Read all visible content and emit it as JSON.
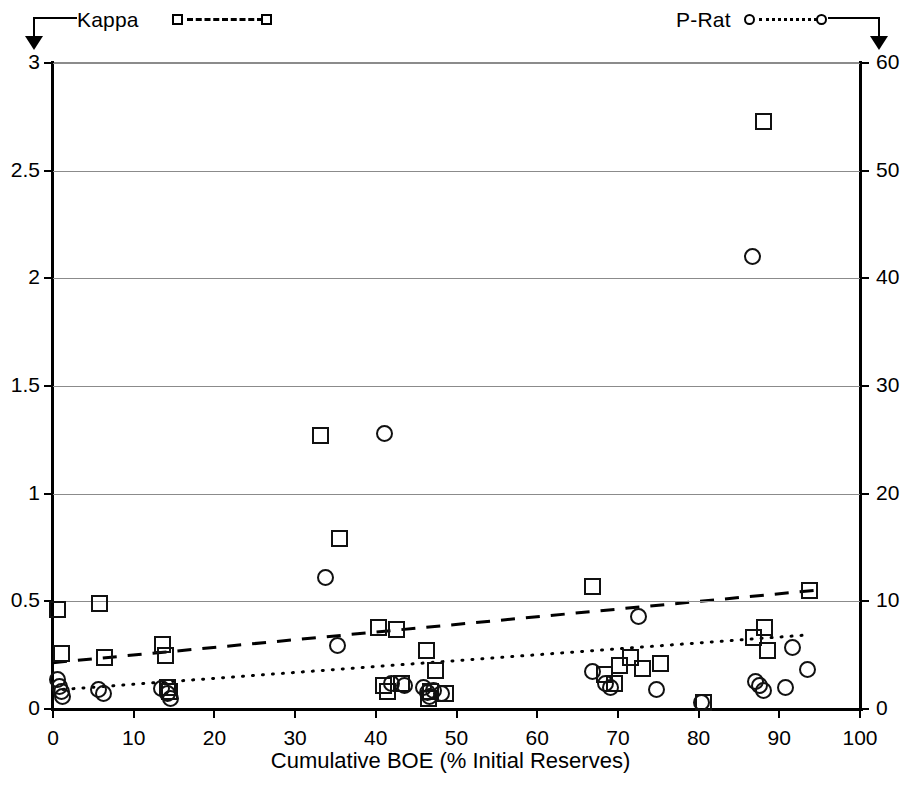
{
  "legend": {
    "kappa": {
      "label": "Kappa",
      "marker": "square",
      "line": "dashed",
      "axis": "left"
    },
    "prat": {
      "label": "P-Rat",
      "marker": "circle",
      "line": "dotted",
      "axis": "right"
    }
  },
  "chart_data": {
    "type": "scatter",
    "title": "",
    "xlabel": "Cumulative BOE (% Initial Reserves)",
    "ylabel_left": "",
    "ylabel_right": "",
    "xlim": [
      0,
      100
    ],
    "ylim_left": [
      0,
      3
    ],
    "ylim_right": [
      0,
      60
    ],
    "xticks": [
      0,
      10,
      20,
      30,
      40,
      50,
      60,
      70,
      80,
      90,
      100
    ],
    "yticks_left": [
      0,
      0.5,
      1,
      1.5,
      2,
      2.5,
      3
    ],
    "yticks_right": [
      0,
      10,
      20,
      30,
      40,
      50,
      60
    ],
    "grid": true,
    "legend_position": "top",
    "series": [
      {
        "name": "Kappa",
        "marker": "square",
        "axis": "left",
        "points": [
          [
            0.6,
            0.46
          ],
          [
            1.0,
            0.26
          ],
          [
            5.8,
            0.49
          ],
          [
            6.4,
            0.24
          ],
          [
            13.6,
            0.3
          ],
          [
            14.0,
            0.25
          ],
          [
            14.2,
            0.1
          ],
          [
            14.4,
            0.08
          ],
          [
            33.2,
            1.27
          ],
          [
            35.5,
            0.79
          ],
          [
            40.3,
            0.38
          ],
          [
            41.0,
            0.11
          ],
          [
            41.4,
            0.08
          ],
          [
            42.6,
            0.37
          ],
          [
            43.2,
            0.12
          ],
          [
            46.3,
            0.27
          ],
          [
            46.5,
            0.05
          ],
          [
            46.8,
            0.08
          ],
          [
            47.4,
            0.18
          ],
          [
            48.6,
            0.07
          ],
          [
            66.8,
            0.57
          ],
          [
            68.4,
            0.16
          ],
          [
            69.6,
            0.12
          ],
          [
            71.5,
            0.24
          ],
          [
            70.2,
            0.2
          ],
          [
            73.0,
            0.19
          ],
          [
            75.3,
            0.21
          ],
          [
            80.6,
            0.03
          ],
          [
            86.8,
            0.33
          ],
          [
            88.0,
            2.73
          ],
          [
            88.2,
            0.38
          ],
          [
            88.5,
            0.27
          ],
          [
            93.8,
            0.55
          ]
        ]
      },
      {
        "name": "P-Rat",
        "marker": "circle",
        "axis": "right",
        "points": [
          [
            0.5,
            2.7
          ],
          [
            0.8,
            2.1
          ],
          [
            1.0,
            1.6
          ],
          [
            1.2,
            1.2
          ],
          [
            5.6,
            1.8
          ],
          [
            6.2,
            1.4
          ],
          [
            13.5,
            1.9
          ],
          [
            14.2,
            1.4
          ],
          [
            14.6,
            1.0
          ],
          [
            33.8,
            12.2
          ],
          [
            35.3,
            5.9
          ],
          [
            41.1,
            25.6
          ],
          [
            45.9,
            2.0
          ],
          [
            46.4,
            1.5
          ],
          [
            46.6,
            1.2
          ],
          [
            47.2,
            1.7
          ],
          [
            42.0,
            2.4
          ],
          [
            43.5,
            2.2
          ],
          [
            48.2,
            1.4
          ],
          [
            66.9,
            3.5
          ],
          [
            68.5,
            2.4
          ],
          [
            69.1,
            2.0
          ],
          [
            72.5,
            8.6
          ],
          [
            74.8,
            1.8
          ],
          [
            80.4,
            0.6
          ],
          [
            86.7,
            42.0
          ],
          [
            87.0,
            2.6
          ],
          [
            87.6,
            2.2
          ],
          [
            88.0,
            1.7
          ],
          [
            90.8,
            2.0
          ],
          [
            91.6,
            5.7
          ],
          [
            93.5,
            3.7
          ]
        ]
      }
    ],
    "trendlines": [
      {
        "name": "Kappa trend",
        "style": "dashed",
        "axis": "left",
        "x": [
          0,
          95
        ],
        "y": [
          0.215,
          0.553
        ]
      },
      {
        "name": "P-Rat trend",
        "style": "dotted",
        "axis": "right",
        "x": [
          0,
          93
        ],
        "y": [
          1.75,
          6.85
        ]
      }
    ]
  }
}
